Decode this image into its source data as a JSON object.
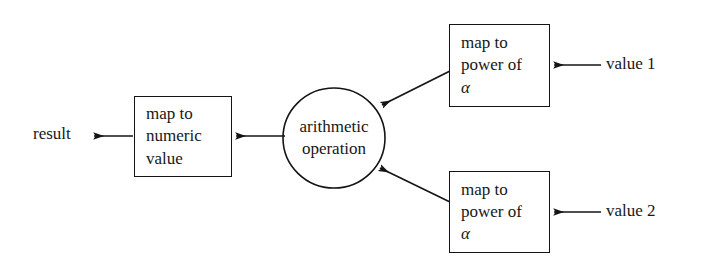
{
  "diagram": {
    "type": "flow-diagram",
    "title": "",
    "background_color": "#ffffff",
    "stroke_color": "#141414",
    "text_color": "#171717",
    "nodes": [
      {
        "id": "result",
        "kind": "label",
        "text": "result",
        "x": 33,
        "y": 124
      },
      {
        "id": "map-to-numeric-value",
        "kind": "box",
        "lines": [
          "map to",
          "numeric",
          "value"
        ],
        "x": 134,
        "y": 96,
        "width": 98,
        "height": 81
      },
      {
        "id": "arithmetic-operation",
        "kind": "ellipse",
        "lines": [
          "arithmetic",
          "operation"
        ],
        "cx": 334,
        "cy": 138,
        "rx": 51,
        "ry": 50
      },
      {
        "id": "map-to-power-of-alpha-1",
        "kind": "box",
        "lines": [
          "map to",
          "power of",
          "α"
        ],
        "x": 449,
        "y": 24,
        "width": 101,
        "height": 83
      },
      {
        "id": "map-to-power-of-alpha-2",
        "kind": "box",
        "lines": [
          "map to",
          "power of",
          "α"
        ],
        "x": 449,
        "y": 171,
        "width": 101,
        "height": 82
      },
      {
        "id": "value-1",
        "kind": "label",
        "text": "value 1",
        "x": 606,
        "y": 54
      },
      {
        "id": "value-2",
        "kind": "label",
        "text": "value 2",
        "x": 606,
        "y": 201
      }
    ],
    "edges": [
      {
        "id": "edge-value1-to-power1",
        "from": "value 1",
        "to": "map to power of α (top)",
        "direction": "right-to-left",
        "x1": 601,
        "y1": 65,
        "x2": 553,
        "y2": 65
      },
      {
        "id": "edge-value2-to-power2",
        "from": "value 2",
        "to": "map to power of α (bottom)",
        "direction": "right-to-left",
        "x1": 601,
        "y1": 212,
        "x2": 553,
        "y2": 212
      },
      {
        "id": "edge-power1-to-operation",
        "from": "map to power of α (top)",
        "to": "arithmetic operation",
        "direction": "diagonal-down-left",
        "x1": 449,
        "y1": 72,
        "x2": 381,
        "y2": 106
      },
      {
        "id": "edge-power2-to-operation",
        "from": "map to power of α (bottom)",
        "to": "arithmetic operation",
        "direction": "diagonal-up-left",
        "x1": 449,
        "y1": 201,
        "x2": 379,
        "y2": 167
      },
      {
        "id": "edge-operation-to-numeric",
        "from": "arithmetic operation",
        "to": "map to numeric value",
        "direction": "right-to-left",
        "x1": 284,
        "y1": 136,
        "x2": 235,
        "y2": 136
      },
      {
        "id": "edge-numeric-to-result",
        "from": "map to numeric value",
        "to": "result",
        "direction": "right-to-left",
        "x1": 133,
        "y1": 136,
        "x2": 93,
        "y2": 136
      }
    ]
  }
}
